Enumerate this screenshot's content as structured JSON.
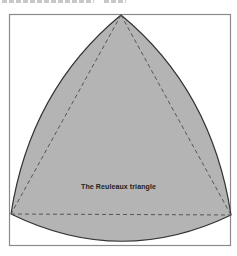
{
  "figure": {
    "label": "The Reuleaux triangle",
    "label_pos": {
      "x": 118,
      "y": 188
    },
    "frame": {
      "x": 9,
      "y": 14,
      "w": 222,
      "h": 232,
      "stroke": "#8a8a8a"
    },
    "vertices": {
      "top": {
        "x": 121,
        "y": 15
      },
      "left": {
        "x": 11,
        "y": 214
      },
      "right": {
        "x": 231,
        "y": 215
      }
    },
    "colors": {
      "fill": "#b4b4b4",
      "outline": "#333333",
      "dashed": "#555555",
      "background": "#ffffff"
    },
    "cropped_caption_visible": true
  }
}
